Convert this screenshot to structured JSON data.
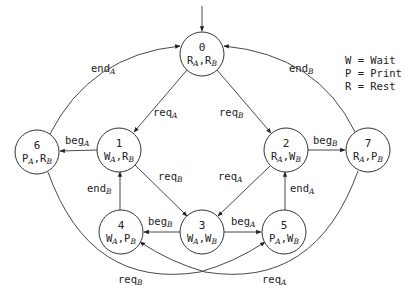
{
  "diagram": {
    "type": "state-machine",
    "initial_state": "0",
    "legend": [
      {
        "key": "W",
        "sep": " = ",
        "value": "Wait"
      },
      {
        "key": "P",
        "sep": " = ",
        "value": "Print"
      },
      {
        "key": "R",
        "sep": " = ",
        "value": "Rest"
      }
    ],
    "nodes": [
      {
        "id": "0",
        "a": "R",
        "b": "R"
      },
      {
        "id": "1",
        "a": "W",
        "b": "R"
      },
      {
        "id": "2",
        "a": "R",
        "b": "W"
      },
      {
        "id": "3",
        "a": "W",
        "b": "W"
      },
      {
        "id": "4",
        "a": "W",
        "b": "P"
      },
      {
        "id": "5",
        "a": "P",
        "b": "W"
      },
      {
        "id": "6",
        "a": "P",
        "b": "R"
      },
      {
        "id": "7",
        "a": "R",
        "b": "P"
      }
    ],
    "edges": [
      {
        "from": "0",
        "to": "1",
        "label": "req",
        "sub": "A"
      },
      {
        "from": "0",
        "to": "2",
        "label": "req",
        "sub": "B"
      },
      {
        "from": "1",
        "to": "6",
        "label": "beg",
        "sub": "A"
      },
      {
        "from": "2",
        "to": "7",
        "label": "beg",
        "sub": "B"
      },
      {
        "from": "1",
        "to": "3",
        "label": "req",
        "sub": "B"
      },
      {
        "from": "2",
        "to": "3",
        "label": "req",
        "sub": "A"
      },
      {
        "from": "3",
        "to": "4",
        "label": "beg",
        "sub": "B"
      },
      {
        "from": "3",
        "to": "5",
        "label": "beg",
        "sub": "A"
      },
      {
        "from": "4",
        "to": "1",
        "label": "end",
        "sub": "B"
      },
      {
        "from": "5",
        "to": "2",
        "label": "end",
        "sub": "A"
      },
      {
        "from": "6",
        "to": "0",
        "label": "end",
        "sub": "A"
      },
      {
        "from": "7",
        "to": "0",
        "label": "end",
        "sub": "B"
      },
      {
        "from": "6",
        "to": "5",
        "label": "req",
        "sub": "B"
      },
      {
        "from": "7",
        "to": "4",
        "label": "req",
        "sub": "A"
      }
    ],
    "subscript_sep": ","
  }
}
